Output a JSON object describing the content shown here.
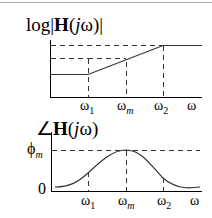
{
  "colors": {
    "line": "#000000",
    "curve": "#333333",
    "dashed": "#333333",
    "border": "#a8a8a8"
  },
  "magnitude_plot": {
    "title_prefix": "log|",
    "title_H": "H",
    "title_open": "(",
    "title_j": "j",
    "title_omega": "ω",
    "title_close": ")|",
    "x_ticks": [
      {
        "base": "ω",
        "sub": "1"
      },
      {
        "base": "ω",
        "sub": "m"
      },
      {
        "base": "ω",
        "sub": "2"
      },
      {
        "base": "ω",
        "sub": ""
      }
    ]
  },
  "phase_plot": {
    "title_angle": "∠",
    "title_H": "H",
    "title_open": "(",
    "title_j": "j",
    "title_omega": "ω",
    "title_close": ")",
    "y_ticks": [
      {
        "base": "ϕ",
        "sub": "m"
      },
      {
        "base": "0",
        "sub": ""
      }
    ],
    "x_ticks": [
      {
        "base": "ω",
        "sub": "1"
      },
      {
        "base": "ω",
        "sub": "m"
      },
      {
        "base": "ω",
        "sub": "2"
      },
      {
        "base": "ω",
        "sub": ""
      }
    ]
  }
}
